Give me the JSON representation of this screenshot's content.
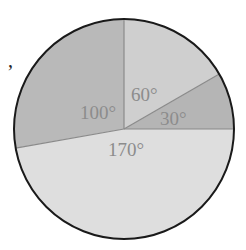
{
  "stray_mark": ",",
  "chart_data": {
    "type": "pie",
    "title": "",
    "unit": "degrees",
    "categories": [
      "30°",
      "60°",
      "100°",
      "170°"
    ],
    "values": [
      30,
      60,
      100,
      170
    ],
    "labels": [
      "30°",
      "60°",
      "100°",
      "170°"
    ],
    "start_angle_deg": 0,
    "direction": "counterclockwise",
    "colors": [
      "#b5b5b5",
      "#cfcfcf",
      "#b9b9b9",
      "#dedede"
    ],
    "label_color": "#8c8c8c",
    "outline_color": "#1a1a1a",
    "divider_color": "#8a8a8a",
    "legend": false,
    "center": [
      124,
      129
    ],
    "radius": 110
  }
}
